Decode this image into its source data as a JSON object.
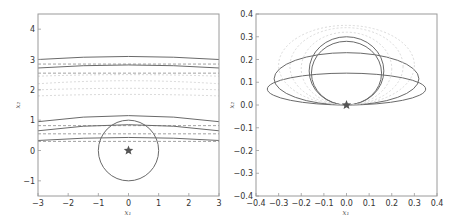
{
  "chart_data": [
    {
      "type": "line",
      "panel": "left",
      "title": "",
      "xlabel": "x1",
      "ylabel": "x2",
      "xlim": [
        -3,
        3
      ],
      "ylim": [
        -1.5,
        4.5
      ],
      "xticks": [
        "−3",
        "−2",
        "−1",
        "0",
        "1",
        "2",
        "3"
      ],
      "yticks": [
        "−1",
        "0",
        "1",
        "2",
        "3",
        "4"
      ],
      "grid": false,
      "marker": {
        "shape": "star",
        "x": 0,
        "y": 0
      },
      "circle": {
        "cx": 0,
        "cy": 0,
        "r": 1
      },
      "series": [
        {
          "name": "upper-solid-dark",
          "style": "solid",
          "y_edge": 3.0,
          "y_center": 3.1
        },
        {
          "name": "upper-dashed-1",
          "style": "dashed",
          "y_edge": 2.85,
          "y_center": 2.85
        },
        {
          "name": "upper-solid-2",
          "style": "solid",
          "y_edge": 2.72,
          "y_center": 2.82
        },
        {
          "name": "upper-dashed-2",
          "style": "dashed",
          "y_edge": 2.55,
          "y_center": 2.55
        },
        {
          "name": "upper-faint-1",
          "style": "dotted",
          "y_edge": 2.45,
          "y_center": 2.5
        },
        {
          "name": "upper-faint-2",
          "style": "dotted",
          "y_edge": 2.2,
          "y_center": 2.3
        },
        {
          "name": "upper-faint-3",
          "style": "dotted",
          "y_edge": 2.0,
          "y_center": 2.05
        },
        {
          "name": "upper-faint-4",
          "style": "dotted",
          "y_edge": 1.8,
          "y_center": 1.85
        },
        {
          "name": "lower-faint",
          "style": "solid",
          "y_edge": 0.95,
          "y_center": 1.15
        },
        {
          "name": "lower-dashed-1",
          "style": "dashed",
          "y_edge": 0.82,
          "y_center": 0.82
        },
        {
          "name": "lower-solid-1",
          "style": "solid",
          "y_edge": 0.65,
          "y_center": 0.85
        },
        {
          "name": "lower-dashed-2",
          "style": "dashed",
          "y_edge": 0.55,
          "y_center": 0.55
        },
        {
          "name": "lower-solid-2",
          "style": "solid",
          "y_edge": 0.33,
          "y_center": 0.43
        },
        {
          "name": "lower-dashed-3",
          "style": "dashed",
          "y_edge": 0.3,
          "y_center": 0.3
        }
      ]
    },
    {
      "type": "line",
      "panel": "right",
      "title": "",
      "xlabel": "x1",
      "ylabel": "x2",
      "xlim": [
        -0.4,
        0.4
      ],
      "ylim": [
        -0.4,
        0.4
      ],
      "xticks": [
        "−0.4",
        "−0.3",
        "−0.2",
        "−0.1",
        "0.0",
        "0.1",
        "0.2",
        "0.3",
        "0.4"
      ],
      "yticks": [
        "−0.4",
        "−0.3",
        "−0.2",
        "−0.1",
        "0.0",
        "0.1",
        "0.2",
        "0.3",
        "0.4"
      ],
      "grid": false,
      "marker": {
        "shape": "star",
        "x": 0,
        "y": 0
      },
      "series": [
        {
          "name": "ellipse-wide-dark",
          "style": "solid",
          "cx": 0,
          "cy": 0.07,
          "rx": 0.35,
          "ry": 0.07
        },
        {
          "name": "ellipse-mid",
          "style": "solid",
          "cx": 0,
          "cy": 0.115,
          "rx": 0.32,
          "ry": 0.115
        },
        {
          "name": "circle-inner-dark",
          "style": "solid",
          "cx": 0,
          "cy": 0.14,
          "rx": 0.155,
          "ry": 0.14
        },
        {
          "name": "circle-inner-2",
          "style": "solid",
          "cx": 0,
          "cy": 0.15,
          "rx": 0.165,
          "ry": 0.15
        },
        {
          "name": "ellipse-faint-1",
          "style": "dotted",
          "cx": 0,
          "cy": 0.16,
          "rx": 0.2,
          "ry": 0.16
        },
        {
          "name": "ellipse-faint-2",
          "style": "dotted",
          "cx": 0,
          "cy": 0.17,
          "rx": 0.25,
          "ry": 0.17
        },
        {
          "name": "ellipse-faint-3",
          "style": "dotted",
          "cx": 0,
          "cy": 0.175,
          "rx": 0.3,
          "ry": 0.175
        }
      ]
    }
  ],
  "panels": {
    "left": {
      "xlabel": "x₁",
      "ylabel": "x₂"
    },
    "right": {
      "xlabel": "x₁",
      "ylabel": "x₂"
    }
  }
}
